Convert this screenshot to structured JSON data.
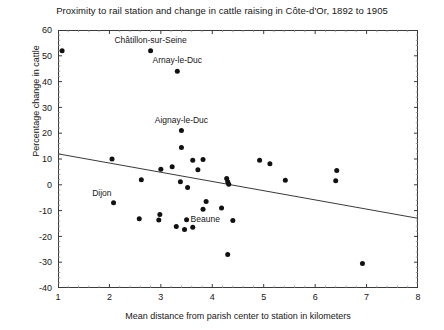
{
  "chart_data": {
    "type": "scatter",
    "title": "Proximity to rail station and change in cattle raising in Côte-d'Or, 1892 to 1905",
    "xlabel": "Mean distance from parish center to station in kilometers",
    "ylabel": "Percentage change in cattle",
    "xlim": [
      1,
      8
    ],
    "ylim": [
      -40,
      60
    ],
    "xticks": [
      1,
      2,
      3,
      4,
      5,
      6,
      7,
      8
    ],
    "yticks": [
      -40,
      -30,
      -20,
      -10,
      0,
      10,
      20,
      30,
      40,
      50,
      60
    ],
    "xtick_labels": [
      "1",
      "2",
      "3",
      "4",
      "5",
      "6",
      "7",
      "8"
    ],
    "ytick_labels": [
      "-40",
      "-30",
      "-20",
      "-10",
      "0",
      "10",
      "20",
      "30",
      "40",
      "50",
      "60"
    ],
    "grid": false,
    "legend": null,
    "marker": "filled-circle",
    "marker_color": "#111111",
    "points": [
      {
        "x": 1.08,
        "y": 52.0,
        "label": null
      },
      {
        "x": 2.8,
        "y": 52.0,
        "label": "Châtillon-sur-Seine",
        "label_dx": 0,
        "label_dy": -8,
        "label_anchor": "middle"
      },
      {
        "x": 3.32,
        "y": 44.0,
        "label": "Arnay-le-Duc",
        "label_dx": 0,
        "label_dy": -8,
        "label_anchor": "middle"
      },
      {
        "x": 3.4,
        "y": 21.0,
        "label": "Aignay-le-Duc",
        "label_dx": 0,
        "label_dy": -8,
        "label_anchor": "middle"
      },
      {
        "x": 3.4,
        "y": 14.5,
        "label": null
      },
      {
        "x": 2.05,
        "y": 10.0,
        "label": null
      },
      {
        "x": 3.22,
        "y": 7.0,
        "label": null
      },
      {
        "x": 3.62,
        "y": 9.5,
        "label": null
      },
      {
        "x": 3.82,
        "y": 9.8,
        "label": null
      },
      {
        "x": 3.72,
        "y": 5.8,
        "label": null
      },
      {
        "x": 3.0,
        "y": 6.0,
        "label": null
      },
      {
        "x": 4.92,
        "y": 9.5,
        "label": null
      },
      {
        "x": 5.12,
        "y": 8.2,
        "label": null
      },
      {
        "x": 6.42,
        "y": 5.5,
        "label": null
      },
      {
        "x": 6.4,
        "y": 1.6,
        "label": null
      },
      {
        "x": 5.42,
        "y": 1.8,
        "label": null
      },
      {
        "x": 2.62,
        "y": 2.0,
        "label": null
      },
      {
        "x": 3.38,
        "y": 1.2,
        "label": null
      },
      {
        "x": 3.52,
        "y": -1.0,
        "label": null
      },
      {
        "x": 4.28,
        "y": 2.4,
        "label": null
      },
      {
        "x": 4.3,
        "y": 1.2,
        "label": null
      },
      {
        "x": 4.32,
        "y": 0.2,
        "label": null
      },
      {
        "x": 3.88,
        "y": -6.5,
        "label": null
      },
      {
        "x": 3.82,
        "y": -9.5,
        "label": null
      },
      {
        "x": 4.18,
        "y": -9.0,
        "label": null
      },
      {
        "x": 2.08,
        "y": -7.0,
        "label": "Dijon",
        "label_dx": -2,
        "label_dy": -7,
        "label_anchor": "end"
      },
      {
        "x": 2.98,
        "y": -11.5,
        "label": null
      },
      {
        "x": 2.58,
        "y": -13.2,
        "label": null
      },
      {
        "x": 2.96,
        "y": -13.6,
        "label": null
      },
      {
        "x": 3.5,
        "y": -13.5,
        "label": "Beaune",
        "label_dx": 4,
        "label_dy": 2,
        "label_anchor": "start"
      },
      {
        "x": 3.62,
        "y": -16.5,
        "label": null
      },
      {
        "x": 4.4,
        "y": -13.8,
        "label": null
      },
      {
        "x": 3.3,
        "y": -16.2,
        "label": null
      },
      {
        "x": 3.46,
        "y": -17.3,
        "label": null
      },
      {
        "x": 4.3,
        "y": -27.0,
        "label": null
      },
      {
        "x": 6.92,
        "y": -30.5,
        "label": null
      }
    ],
    "trendline": {
      "x0": 1.0,
      "y0": 12.0,
      "x1": 8.0,
      "y1": -13.0,
      "color": "#3a3a3a"
    }
  }
}
